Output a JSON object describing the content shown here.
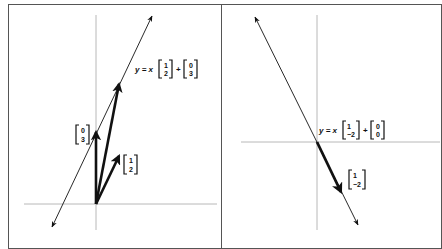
{
  "figure": {
    "panels": [
      {
        "id": "left",
        "equation": {
          "prefix": "y = x",
          "direction": [
            "1",
            "2"
          ],
          "plus": "+",
          "offset": [
            "0",
            "3"
          ]
        },
        "vectors": [
          {
            "name": "offset",
            "label": [
              "0",
              "3"
            ],
            "components": [
              0,
              3
            ]
          },
          {
            "name": "direction",
            "label": [
              "1",
              "2"
            ],
            "components": [
              1,
              2
            ]
          },
          {
            "name": "sum",
            "label": null,
            "components": [
              1,
              5
            ]
          }
        ],
        "line": {
          "point": [
            0,
            3
          ],
          "direction": [
            1,
            2
          ]
        }
      },
      {
        "id": "right",
        "equation": {
          "prefix": "y = x",
          "direction": [
            "1",
            "−2"
          ],
          "plus": "+",
          "offset": [
            "0",
            "0"
          ]
        },
        "vectors": [
          {
            "name": "direction",
            "label": [
              "1",
              "−2"
            ],
            "components": [
              1,
              -2
            ]
          }
        ],
        "line": {
          "point": [
            0,
            0
          ],
          "direction": [
            1,
            -2
          ]
        }
      }
    ],
    "colors": {
      "axis": "#b8b8b8",
      "ink": "#111111",
      "frame": "#555555"
    }
  }
}
